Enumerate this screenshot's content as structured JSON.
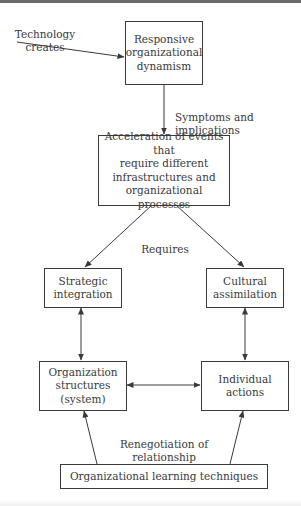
{
  "diagram": {
    "nodes": {
      "responsive": {
        "label": "Responsive\norganizational\ndynamism"
      },
      "acceleration": {
        "label": "Acceleration of events that\nrequire different\ninfrastructures and\norganizational processes"
      },
      "strategic": {
        "label": "Strategic\nintegration"
      },
      "cultural": {
        "label": "Cultural\nassimilation"
      },
      "organization": {
        "label": "Organization\nstructures\n(system)"
      },
      "individual": {
        "label": "Individual\nactions"
      },
      "learning": {
        "label": "Organizational learning techniques"
      }
    },
    "edge_labels": {
      "technology": "Technology\ncreates",
      "symptoms": "Symptoms and\nimplications",
      "requires": "Requires",
      "renegotiation": "Renegotiation of\nrelationship"
    },
    "edges": [
      {
        "from": "technology",
        "to": "responsive",
        "type": "arrow"
      },
      {
        "from": "responsive",
        "to": "acceleration",
        "type": "arrow"
      },
      {
        "from": "acceleration",
        "to": "strategic",
        "type": "arrow"
      },
      {
        "from": "acceleration",
        "to": "cultural",
        "type": "arrow"
      },
      {
        "from": "strategic",
        "to": "organization",
        "type": "double-arrow"
      },
      {
        "from": "cultural",
        "to": "individual",
        "type": "double-arrow"
      },
      {
        "from": "organization",
        "to": "individual",
        "type": "double-arrow"
      },
      {
        "from": "learning",
        "to": "organization",
        "type": "arrow"
      },
      {
        "from": "learning",
        "to": "individual",
        "type": "arrow"
      }
    ],
    "colors": {
      "line": "#3a3a3a",
      "text": "#3a3a3a",
      "background": "#ffffff"
    }
  }
}
